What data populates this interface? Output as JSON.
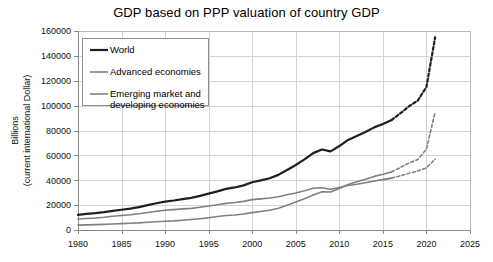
{
  "chart_data": {
    "type": "line",
    "title": "GDP based on PPP valuation of country GDP",
    "xlabel": "",
    "ylabel": "Billions\n(current international Dollar)",
    "ylabel_line1": "Billions",
    "ylabel_line2": "(current international Dollar)",
    "xlim": [
      1980,
      2025
    ],
    "ylim": [
      0,
      160000
    ],
    "xticks": [
      1980,
      1985,
      1990,
      1995,
      2000,
      2005,
      2010,
      2015,
      2020,
      2025
    ],
    "yticks": [
      0,
      20000,
      40000,
      60000,
      80000,
      100000,
      120000,
      140000,
      160000
    ],
    "grid": true,
    "legend_position": "upper-left-inside",
    "forecast_start_year": 2016,
    "forecast_style": "dashed",
    "series": [
      {
        "name": "World",
        "color": "#1f1f1f",
        "width": 2.2,
        "x": [
          1980,
          1981,
          1982,
          1983,
          1984,
          1985,
          1986,
          1987,
          1988,
          1989,
          1990,
          1991,
          1992,
          1993,
          1994,
          1995,
          1996,
          1997,
          1998,
          1999,
          2000,
          2001,
          2002,
          2003,
          2004,
          2005,
          2006,
          2007,
          2008,
          2009,
          2010,
          2011,
          2012,
          2013,
          2014,
          2015,
          2016,
          2017,
          2018,
          2019,
          2020,
          2021
        ],
        "values": [
          12200,
          12900,
          13500,
          14300,
          15400,
          16300,
          17200,
          18400,
          20000,
          21500,
          22800,
          23700,
          24800,
          25800,
          27400,
          29200,
          31100,
          33100,
          34200,
          35900,
          38400,
          39900,
          41600,
          44300,
          48300,
          52300,
          56800,
          61800,
          64700,
          63200,
          67500,
          72400,
          75600,
          78800,
          82500,
          85300,
          88400,
          93800,
          99500,
          104000,
          115000,
          155000
        ]
      },
      {
        "name": "Advanced economies",
        "color": "#808080",
        "width": 1.6,
        "x": [
          1980,
          1981,
          1982,
          1983,
          1984,
          1985,
          1986,
          1987,
          1988,
          1989,
          1990,
          1991,
          1992,
          1993,
          1994,
          1995,
          1996,
          1997,
          1998,
          1999,
          2000,
          2001,
          2002,
          2003,
          2004,
          2005,
          2006,
          2007,
          2008,
          2009,
          2010,
          2011,
          2012,
          2013,
          2014,
          2015,
          2016,
          2017,
          2018,
          2019,
          2020,
          2021
        ],
        "values": [
          8800,
          9300,
          9700,
          10300,
          11100,
          11700,
          12300,
          13100,
          14100,
          15100,
          15900,
          16400,
          17000,
          17400,
          18300,
          19300,
          20300,
          21400,
          22100,
          23000,
          24400,
          25000,
          25700,
          26800,
          28300,
          29800,
          31600,
          33600,
          34000,
          32700,
          34200,
          35800,
          36800,
          38000,
          39400,
          40500,
          41700,
          43600,
          45600,
          47400,
          50000,
          57000
        ]
      },
      {
        "name": "Emerging market and developing economies",
        "color": "#808080",
        "width": 1.6,
        "x": [
          1980,
          1981,
          1982,
          1983,
          1984,
          1985,
          1986,
          1987,
          1988,
          1989,
          1990,
          1991,
          1992,
          1993,
          1994,
          1995,
          1996,
          1997,
          1998,
          1999,
          2000,
          2001,
          2002,
          2003,
          2004,
          2005,
          2006,
          2007,
          2008,
          2009,
          2010,
          2011,
          2012,
          2013,
          2014,
          2015,
          2016,
          2017,
          2018,
          2019,
          2020,
          2021
        ],
        "values": [
          3900,
          4100,
          4300,
          4500,
          4800,
          5100,
          5400,
          5700,
          6200,
          6600,
          7000,
          7300,
          7800,
          8400,
          9100,
          9900,
          10800,
          11700,
          12100,
          12900,
          14000,
          14900,
          15900,
          17500,
          20000,
          22500,
          25200,
          28200,
          30700,
          30500,
          33300,
          36600,
          38800,
          40800,
          43100,
          44800,
          46700,
          50200,
          53900,
          56600,
          65000,
          95000
        ]
      }
    ],
    "legend": [
      {
        "label": "World",
        "color": "#1f1f1f",
        "width": 2.2
      },
      {
        "label": "Advanced economies",
        "color": "#808080",
        "width": 1.6
      },
      {
        "label": "Emerging market and",
        "label2": "developing economies",
        "color": "#808080",
        "width": 1.6
      }
    ],
    "colors": {
      "grid": "#d3d3d3",
      "frame": "#bdbdbd",
      "axis": "#8a8a8a",
      "world": "#1f1f1f",
      "gray_series": "#808080",
      "background": "#ffffff",
      "text": "#111111"
    }
  }
}
